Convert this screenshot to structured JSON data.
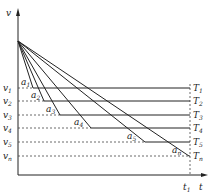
{
  "axes": {
    "y_label": "v",
    "x_label": "t",
    "t1_label": "t",
    "t1_sub": "1"
  },
  "origin_point": {
    "x": 18,
    "y": 41
  },
  "levels": [
    {
      "v": "v",
      "v_sub": "1",
      "a": "a",
      "a_sub": "1",
      "T": "T",
      "T_sub": "1",
      "y": 88,
      "knee_x": 33
    },
    {
      "v": "v",
      "v_sub": "2",
      "a": "a",
      "a_sub": "2",
      "T": "T",
      "T_sub": "2",
      "y": 101,
      "knee_x": 44
    },
    {
      "v": "v",
      "v_sub": "3",
      "a": "a",
      "a_sub": "3",
      "T": "T",
      "T_sub": "3",
      "y": 115,
      "knee_x": 60
    },
    {
      "v": "v",
      "v_sub": "4",
      "a": "a",
      "a_sub": "4",
      "T": "T",
      "T_sub": "4",
      "y": 128,
      "knee_x": 91
    },
    {
      "v": "v",
      "v_sub": "5",
      "a": "a",
      "a_sub": "5",
      "T": "T",
      "T_sub": "5",
      "y": 142,
      "knee_x": 145
    },
    {
      "v": "v",
      "v_sub": "n",
      "a": "a",
      "a_sub": "n",
      "T": "T",
      "T_sub": "n",
      "y": 156,
      "knee_x": 189
    }
  ],
  "colors": {
    "line": "#222222",
    "dash": "#444444"
  }
}
